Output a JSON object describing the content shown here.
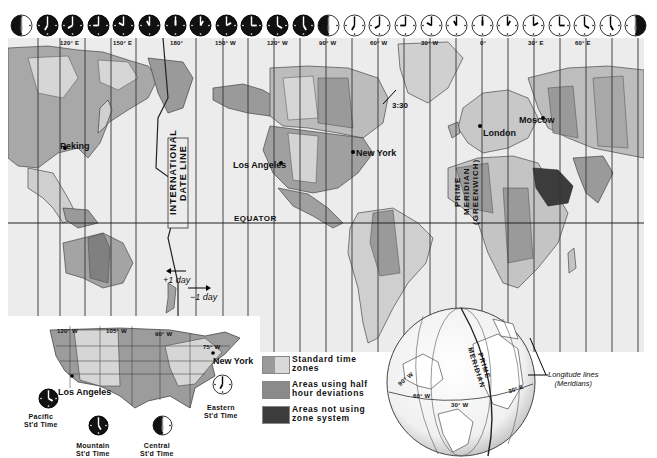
{
  "map": {
    "title": "World Time Zones",
    "top_clocks": [
      {
        "hour": 6,
        "minute": 0,
        "style": "half"
      },
      {
        "hour": 7,
        "minute": 0,
        "style": "dark"
      },
      {
        "hour": 8,
        "minute": 0,
        "style": "dark"
      },
      {
        "hour": 9,
        "minute": 0,
        "style": "dark"
      },
      {
        "hour": 10,
        "minute": 0,
        "style": "dark"
      },
      {
        "hour": 11,
        "minute": 0,
        "style": "dark"
      },
      {
        "hour": 12,
        "minute": 0,
        "style": "dark"
      },
      {
        "hour": 1,
        "minute": 0,
        "style": "dark"
      },
      {
        "hour": 2,
        "minute": 0,
        "style": "dark"
      },
      {
        "hour": 3,
        "minute": 0,
        "style": "dark"
      },
      {
        "hour": 4,
        "minute": 0,
        "style": "dark"
      },
      {
        "hour": 5,
        "minute": 0,
        "style": "dark"
      },
      {
        "hour": 6,
        "minute": 0,
        "style": "half"
      },
      {
        "hour": 7,
        "minute": 0,
        "style": "light"
      },
      {
        "hour": 8,
        "minute": 0,
        "style": "light"
      },
      {
        "hour": 9,
        "minute": 0,
        "style": "light"
      },
      {
        "hour": 10,
        "minute": 0,
        "style": "light"
      },
      {
        "hour": 11,
        "minute": 0,
        "style": "light"
      },
      {
        "hour": 12,
        "minute": 0,
        "style": "light"
      },
      {
        "hour": 1,
        "minute": 0,
        "style": "light"
      },
      {
        "hour": 2,
        "minute": 0,
        "style": "light"
      },
      {
        "hour": 3,
        "minute": 0,
        "style": "light"
      },
      {
        "hour": 4,
        "minute": 0,
        "style": "light"
      },
      {
        "hour": 5,
        "minute": 0,
        "style": "light"
      },
      {
        "hour": 6,
        "minute": 0,
        "style": "half-right"
      }
    ],
    "longitude_labels": [
      {
        "text": "120° E",
        "x": 60
      },
      {
        "text": "150° E",
        "x": 113
      },
      {
        "text": "180°",
        "x": 170
      },
      {
        "text": "150° W",
        "x": 215
      },
      {
        "text": "120° W",
        "x": 267
      },
      {
        "text": "90° W",
        "x": 319
      },
      {
        "text": "60° W",
        "x": 370
      },
      {
        "text": "30° W",
        "x": 421
      },
      {
        "text": "0°",
        "x": 480
      },
      {
        "text": "30° E",
        "x": 528
      },
      {
        "text": "60° E",
        "x": 575
      }
    ],
    "cities": [
      {
        "name": "Peking",
        "x": 60,
        "y": 141,
        "dx": 65,
        "dy": 148
      },
      {
        "name": "Los Angeles",
        "x": 233,
        "y": 160,
        "dx": 281,
        "dy": 163
      },
      {
        "name": "New York",
        "x": 356,
        "y": 148,
        "dx": 353,
        "dy": 152
      },
      {
        "name": "London",
        "x": 483,
        "y": 128,
        "dx": 480,
        "dy": 126
      },
      {
        "name": "Moscow",
        "x": 519,
        "y": 115,
        "dx": 543,
        "dy": 118
      }
    ],
    "half_hour_note": "3:30",
    "date_line_label": [
      "INTERNATIONAL",
      "DATE LINE"
    ],
    "prime_meridian_label": [
      "PRIME",
      "MERIDIAN",
      "(GREENWICH)"
    ],
    "equator_label": "EQUATOR",
    "day_labels": {
      "plus": "+1 day",
      "minus": "−1 day"
    }
  },
  "inset_usa": {
    "longitude_labels": [
      "120° W",
      "105° W",
      "90° W",
      "75° W"
    ],
    "cities": [
      "Los Angeles",
      "New York"
    ],
    "clocks": [
      {
        "label_line1": "Pacific",
        "label_line2": "St'd Time",
        "hour": 4,
        "minute": 0,
        "style": "dark"
      },
      {
        "label_line1": "Mountain",
        "label_line2": "St'd Time",
        "hour": 5,
        "minute": 0,
        "style": "dark"
      },
      {
        "label_line1": "Central",
        "label_line2": "St'd Time",
        "hour": 6,
        "minute": 0,
        "style": "half"
      },
      {
        "label_line1": "Eastern",
        "label_line2": "St'd Time",
        "hour": 7,
        "minute": 0,
        "style": "light"
      }
    ]
  },
  "legend": {
    "items": [
      {
        "label_line1": "Standard time",
        "label_line2": "zones",
        "color": "#9a9a9a",
        "color2": "#d9d9d9"
      },
      {
        "label_line1": "Areas using half",
        "label_line2": "hour deviations",
        "color": "#8a8a8a"
      },
      {
        "label_line1": "Areas not using",
        "label_line2": "zone system",
        "color": "#3c3c3c"
      }
    ]
  },
  "globe": {
    "labels": [
      "PRIME",
      "MERIDIAN"
    ],
    "lon_labels": [
      "90° W",
      "60° W",
      "30° W",
      "30° E"
    ],
    "note_line1": "Longitude lines",
    "note_line2": "(Meridians)"
  },
  "colors": {
    "ocean": "#ececec",
    "land_light": "#d4d4d4",
    "land_mid": "#9d9d9d",
    "land_dark": "#7a7a7a",
    "no_zone": "#3c3c3c",
    "line": "#333333"
  }
}
